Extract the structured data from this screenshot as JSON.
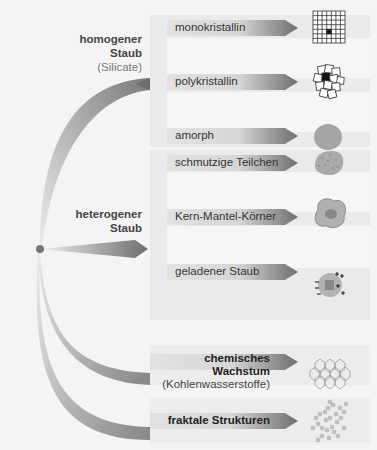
{
  "diagram": {
    "groups": [
      {
        "title_line1": "homogener",
        "title_line2": "Staub",
        "subtitle": "(Silicate)"
      },
      {
        "title_line1": "heterogener",
        "title_line2": "Staub"
      }
    ],
    "branches": [
      {
        "label": "monokristallin",
        "icon": "grid-crystal-icon"
      },
      {
        "label": "polykristallin",
        "icon": "polycrystal-icon"
      },
      {
        "label": "amorph",
        "icon": "amorphous-blob-icon"
      },
      {
        "label": "schmutzige Teilchen",
        "icon": "dirty-particle-icon"
      },
      {
        "label": "Kern-Mantel-Körner",
        "icon": "core-mantle-grain-icon"
      },
      {
        "label": "geladener Staub",
        "icon": "charged-dust-icon"
      },
      {
        "label": "chemisches Wachstum",
        "sublabel": "(Kohlenwasserstoffe)",
        "icon": "hexagon-lattice-icon"
      },
      {
        "label": "fraktale Strukturen",
        "icon": "fractal-aggregate-icon"
      }
    ],
    "colors": {
      "background": "#f4f4f4",
      "panel": "#e6e6e6",
      "arrow_dark": "#6e6e6e",
      "origin_dot": "#777777"
    }
  }
}
